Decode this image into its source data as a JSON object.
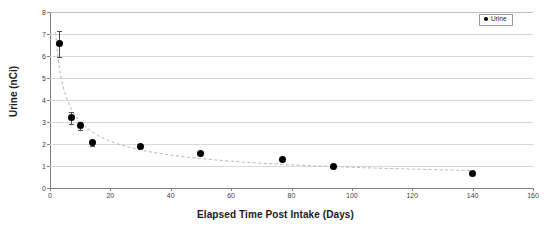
{
  "chart_data": {
    "type": "scatter",
    "title": "",
    "xlabel": "Elapsed Time Post Intake (Days)",
    "ylabel": "Urine  (nCi)",
    "xlim": [
      0,
      160
    ],
    "ylim": [
      0,
      8
    ],
    "xticks": [
      0,
      20,
      40,
      60,
      80,
      100,
      120,
      140,
      160
    ],
    "yticks": [
      0,
      1,
      2,
      3,
      4,
      5,
      6,
      7,
      8
    ],
    "grid": "horizontal",
    "legend_position": "top-right",
    "series": [
      {
        "name": "Urine",
        "marker": "filled-circle",
        "color": "#000000",
        "trendline": "dashed-power-fit",
        "trendline_color": "#b0b0b0",
        "x": [
          3,
          7,
          10,
          14,
          30,
          50,
          77,
          94,
          140
        ],
        "y": [
          6.55,
          3.2,
          2.82,
          2.05,
          1.9,
          1.55,
          1.3,
          0.98,
          0.65
        ],
        "yerr": [
          0.6,
          0.27,
          0.2,
          0.13,
          0.1,
          0.07,
          0.05,
          0.0,
          0.0
        ]
      }
    ]
  },
  "legend": {
    "entries": [
      {
        "label": "Urine",
        "color": "#000000"
      }
    ]
  },
  "axes": {
    "x_tick_labels": [
      "0",
      "20",
      "40",
      "60",
      "80",
      "100",
      "120",
      "140",
      "160"
    ],
    "y_tick_labels": [
      "0",
      "1",
      "2",
      "3",
      "4",
      "5",
      "6",
      "7",
      "8"
    ]
  }
}
